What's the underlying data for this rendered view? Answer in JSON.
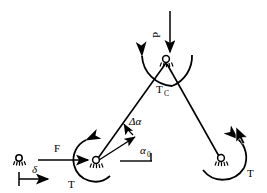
{
  "figure": {
    "title": "",
    "background_color": "#ffffff",
    "ink_color": "#000000",
    "width": 267,
    "height": 193
  },
  "labels": {
    "load_p": "P",
    "torque_center": "T",
    "torque_center_sub": "C",
    "force_f": "F",
    "displacement_delta": "δ",
    "torque_left": "T",
    "torque_right": "T",
    "angle_change": "Δα",
    "angle_initial": "α",
    "angle_initial_sub": "0"
  },
  "joints": [
    {
      "name": "apex-joint",
      "x": 166,
      "y": 62
    },
    {
      "name": "left-joint",
      "x": 94,
      "y": 163
    },
    {
      "name": "right-joint",
      "x": 221,
      "y": 160
    },
    {
      "name": "reference-support",
      "x": 19,
      "y": 160
    }
  ],
  "members": [
    {
      "name": "left-member",
      "from": [
        94,
        163
      ],
      "to": [
        166,
        62
      ]
    },
    {
      "name": "right-member",
      "from": [
        166,
        62
      ],
      "to": [
        221,
        160
      ]
    }
  ],
  "arrows": {
    "load_arrow": {
      "from": [
        170,
        12
      ],
      "to": [
        170,
        58
      ],
      "direction": "down"
    },
    "force_arrow": {
      "from": [
        48,
        156
      ],
      "to": [
        92,
        160
      ],
      "direction": "right"
    },
    "delta_arrow": {
      "from": [
        20,
        179
      ],
      "to": [
        56,
        179
      ],
      "direction": "right"
    },
    "alpha0_arrow": {
      "from": [
        96,
        162
      ],
      "to": [
        130,
        138
      ],
      "direction": "up-right"
    }
  },
  "cursor": {
    "name": "mouse-pointer",
    "x": 236,
    "y": 130
  }
}
